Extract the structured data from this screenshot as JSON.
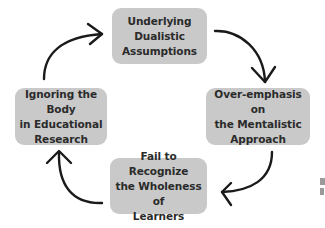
{
  "diagram": {
    "type": "cycle",
    "nodes": [
      {
        "id": "top",
        "label": "Underlying\nDualistic\nAssumptions"
      },
      {
        "id": "right",
        "label": "Over-emphasis on\nthe Mentalistic\nApproach"
      },
      {
        "id": "bottom",
        "label": "Fail to Recognize\nthe Wholeness of\nLearners"
      },
      {
        "id": "left",
        "label": "Ignoring the Body\nin Educational\nResearch"
      }
    ],
    "edges": [
      {
        "from": "top",
        "to": "right"
      },
      {
        "from": "right",
        "to": "bottom"
      },
      {
        "from": "bottom",
        "to": "left"
      },
      {
        "from": "left",
        "to": "top"
      }
    ],
    "colors": {
      "box_fill": "#c9c9c9",
      "text": "#2b2b2b",
      "arrow": "#1a1a1a",
      "background": "#ffffff"
    }
  }
}
